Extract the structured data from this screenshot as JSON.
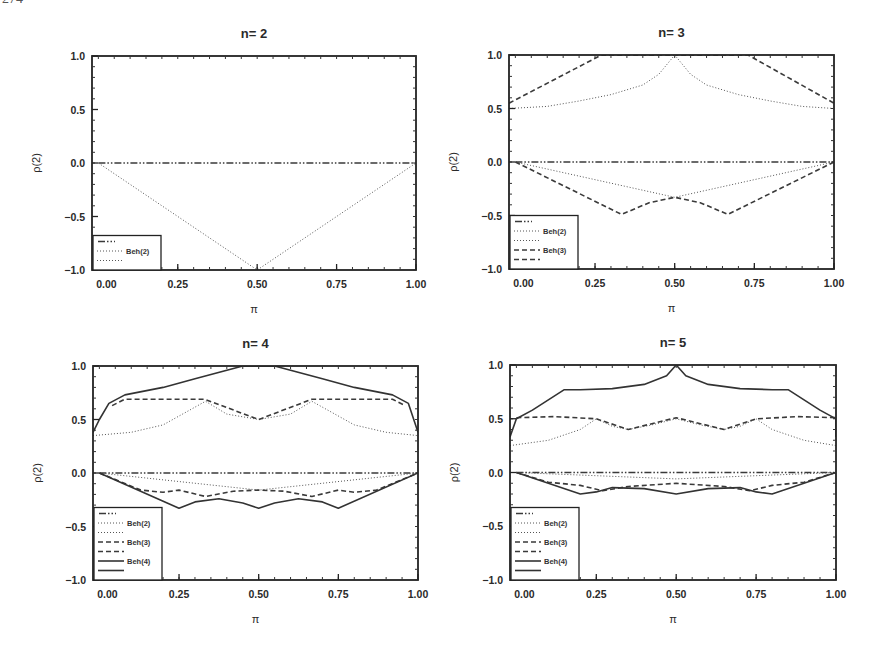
{
  "page": {
    "number_fragment": "274"
  },
  "chart_data": [
    {
      "type": "line",
      "title": "n= 2",
      "xlabel": "π",
      "ylabel": "ρ(2)",
      "xlim": [
        -0.02,
        1.0
      ],
      "ylim": [
        -1.0,
        1.0
      ],
      "xticks": [
        "0.00",
        "0.25",
        "0.50",
        "0.75",
        "1.00"
      ],
      "yticks": [
        "1.0",
        "0.5",
        "0.0",
        "-0.5",
        "-1.0"
      ],
      "frame": {
        "x": 92,
        "y": 56,
        "w": 324,
        "h": 214
      },
      "legend": {
        "position": "lower left",
        "entries": [
          {
            "style": "dashdot",
            "label": ""
          },
          {
            "style": "dotted",
            "label": "Beh(2)"
          },
          {
            "style": "dotted",
            "label": ""
          }
        ]
      },
      "series": [
        {
          "name": "zero",
          "style": "dashdot",
          "x": [
            0,
            1
          ],
          "y": [
            0,
            0
          ]
        },
        {
          "name": "Beh(2) lower",
          "style": "dotted",
          "x": [
            0,
            0.5,
            1
          ],
          "y": [
            0,
            -1.0,
            0
          ]
        }
      ]
    },
    {
      "type": "line",
      "title": "n= 3",
      "xlabel": "π",
      "ylabel": "ρ(2)",
      "xlim": [
        -0.02,
        1.0
      ],
      "ylim": [
        -1.0,
        1.0
      ],
      "xticks": [
        "0.00",
        "0.25",
        "0.50",
        "0.75",
        "1.00"
      ],
      "yticks": [
        "1.0",
        "0.5",
        "0.0",
        "-0.5",
        "-1.0"
      ],
      "frame": {
        "x": 509,
        "y": 55,
        "w": 325,
        "h": 214
      },
      "legend": {
        "position": "lower left",
        "entries": [
          {
            "style": "dashdot",
            "label": ""
          },
          {
            "style": "dotted",
            "label": "Beh(2)"
          },
          {
            "style": "dotted",
            "label": ""
          },
          {
            "style": "dashed",
            "label": "Beh(3)"
          },
          {
            "style": "dashed",
            "label": ""
          }
        ]
      },
      "series": [
        {
          "name": "zero",
          "style": "dashdot",
          "x": [
            0,
            1
          ],
          "y": [
            0,
            0
          ]
        },
        {
          "name": "Beh(2) upper",
          "style": "dotted",
          "x": [
            -0.02,
            0.1,
            0.2,
            0.3,
            0.4,
            0.45,
            0.5,
            0.55,
            0.6,
            0.7,
            0.8,
            0.9,
            1.0
          ],
          "y": [
            0.5,
            0.52,
            0.57,
            0.63,
            0.72,
            0.82,
            1.0,
            0.82,
            0.72,
            0.63,
            0.57,
            0.52,
            0.5
          ]
        },
        {
          "name": "Beh(2) lower",
          "style": "dotted",
          "x": [
            0,
            0.5,
            1
          ],
          "y": [
            0,
            -0.33,
            0
          ]
        },
        {
          "name": "Beh(3) upper",
          "style": "dashed",
          "x": [
            -0.02,
            0.27,
            0.73,
            1.0
          ],
          "y": [
            0.55,
            1.0,
            1.0,
            0.55
          ]
        },
        {
          "name": "Beh(3) lower",
          "style": "dashed",
          "x": [
            0,
            0.333,
            0.42,
            0.5,
            0.58,
            0.667,
            1.0
          ],
          "y": [
            0,
            -0.49,
            -0.38,
            -0.33,
            -0.38,
            -0.49,
            0
          ]
        }
      ]
    },
    {
      "type": "line",
      "title": "n= 4",
      "xlabel": "π",
      "ylabel": "ρ(2)",
      "xlim": [
        -0.02,
        1.0
      ],
      "ylim": [
        -1.0,
        1.0
      ],
      "xticks": [
        "0.00",
        "0.25",
        "0.50",
        "0.75",
        "1.00"
      ],
      "yticks": [
        "1.0",
        "0.5",
        "0.0",
        "-0.5",
        "-1.0"
      ],
      "frame": {
        "x": 93,
        "y": 366,
        "w": 325,
        "h": 214
      },
      "legend": {
        "position": "lower left",
        "entries": [
          {
            "style": "dashdot",
            "label": ""
          },
          {
            "style": "dotted",
            "label": "Beh(2)"
          },
          {
            "style": "dotted",
            "label": ""
          },
          {
            "style": "dashed",
            "label": "Beh(3)"
          },
          {
            "style": "dashed",
            "label": ""
          },
          {
            "style": "solid",
            "label": "Beh(4)"
          },
          {
            "style": "solid",
            "label": ""
          }
        ]
      },
      "series": [
        {
          "name": "zero",
          "style": "dashdot",
          "x": [
            0,
            1
          ],
          "y": [
            0,
            0
          ]
        },
        {
          "name": "Beh(2) upper",
          "style": "dotted",
          "x": [
            -0.02,
            0.1,
            0.2,
            0.333,
            0.4,
            0.5,
            0.6,
            0.667,
            0.8,
            0.9,
            1.0
          ],
          "y": [
            0.35,
            0.38,
            0.45,
            0.67,
            0.55,
            0.5,
            0.55,
            0.67,
            0.45,
            0.38,
            0.35
          ]
        },
        {
          "name": "Beh(2) lower",
          "style": "dotted",
          "x": [
            0,
            0.5,
            1
          ],
          "y": [
            0,
            -0.16,
            0
          ]
        },
        {
          "name": "Beh(3) upper",
          "style": "dashed",
          "x": [
            0.04,
            0.08,
            0.33,
            0.5,
            0.667,
            0.92,
            0.96
          ],
          "y": [
            0.63,
            0.69,
            0.69,
            0.5,
            0.69,
            0.69,
            0.63
          ]
        },
        {
          "name": "Beh(3) lower",
          "style": "dashed",
          "x": [
            0,
            0.13,
            0.2,
            0.25,
            0.333,
            0.42,
            0.5,
            0.58,
            0.667,
            0.75,
            0.8,
            0.87,
            1.0
          ],
          "y": [
            0,
            -0.16,
            -0.18,
            -0.16,
            -0.22,
            -0.17,
            -0.16,
            -0.17,
            -0.22,
            -0.16,
            -0.18,
            -0.16,
            0
          ]
        },
        {
          "name": "Beh(4) upper",
          "style": "solid",
          "x": [
            -0.02,
            0.0,
            0.03,
            0.08,
            0.2,
            0.3,
            0.45,
            0.5,
            0.55,
            0.7,
            0.8,
            0.92,
            0.97,
            1.0
          ],
          "y": [
            0.38,
            0.5,
            0.65,
            0.73,
            0.8,
            0.88,
            1.0,
            1.0,
            1.0,
            0.88,
            0.8,
            0.73,
            0.65,
            0.38
          ]
        },
        {
          "name": "Beh(4) lower",
          "style": "solid",
          "x": [
            0,
            0.25,
            0.3,
            0.375,
            0.45,
            0.5,
            0.55,
            0.625,
            0.7,
            0.75,
            1.0
          ],
          "y": [
            0,
            -0.33,
            -0.27,
            -0.24,
            -0.28,
            -0.33,
            -0.28,
            -0.24,
            -0.27,
            -0.33,
            0
          ]
        }
      ]
    },
    {
      "type": "line",
      "title": "n= 5",
      "xlabel": "π",
      "ylabel": "ρ(2)",
      "xlim": [
        -0.02,
        1.0
      ],
      "ylim": [
        -1.0,
        1.0
      ],
      "xticks": [
        "0.00",
        "0.25",
        "0.50",
        "0.75",
        "1.00"
      ],
      "yticks": [
        "1.0",
        "0.5",
        "0.0",
        "-0.5",
        "-1.0"
      ],
      "frame": {
        "x": 510,
        "y": 365,
        "w": 326,
        "h": 215
      },
      "legend": {
        "position": "lower left",
        "entries": [
          {
            "style": "dashdot",
            "label": ""
          },
          {
            "style": "dotted",
            "label": "Beh(2)"
          },
          {
            "style": "dotted",
            "label": ""
          },
          {
            "style": "dashed",
            "label": "Beh(3)"
          },
          {
            "style": "dashed",
            "label": ""
          },
          {
            "style": "solid",
            "label": "Beh(4)"
          },
          {
            "style": "solid",
            "label": ""
          }
        ]
      },
      "series": [
        {
          "name": "zero",
          "style": "dashdot",
          "x": [
            0,
            1
          ],
          "y": [
            0,
            0
          ]
        },
        {
          "name": "Beh(2) upper",
          "style": "dotted",
          "x": [
            -0.02,
            0.1,
            0.2,
            0.25,
            0.3,
            0.35,
            0.42,
            0.5,
            0.58,
            0.65,
            0.7,
            0.75,
            0.8,
            0.9,
            1.0
          ],
          "y": [
            0.25,
            0.3,
            0.4,
            0.5,
            0.43,
            0.4,
            0.44,
            0.5,
            0.44,
            0.4,
            0.43,
            0.5,
            0.4,
            0.3,
            0.25
          ]
        },
        {
          "name": "Beh(2) lower",
          "style": "dotted",
          "x": [
            0,
            0.5,
            1
          ],
          "y": [
            0,
            -0.06,
            0
          ]
        },
        {
          "name": "Beh(3) upper",
          "style": "dashed",
          "x": [
            0.0,
            0.12,
            0.25,
            0.35,
            0.5,
            0.65,
            0.75,
            0.88,
            1.0
          ],
          "y": [
            0.51,
            0.52,
            0.5,
            0.4,
            0.51,
            0.4,
            0.5,
            0.52,
            0.51
          ]
        },
        {
          "name": "Beh(3) lower",
          "style": "dashed",
          "x": [
            0,
            0.1,
            0.2,
            0.27,
            0.35,
            0.5,
            0.65,
            0.73,
            0.8,
            0.9,
            1.0
          ],
          "y": [
            0,
            -0.09,
            -0.12,
            -0.17,
            -0.13,
            -0.1,
            -0.13,
            -0.17,
            -0.12,
            -0.09,
            0
          ]
        },
        {
          "name": "Beh(4) upper",
          "style": "solid",
          "x": [
            -0.02,
            0.0,
            0.05,
            0.15,
            0.2,
            0.3,
            0.4,
            0.47,
            0.5,
            0.53,
            0.6,
            0.7,
            0.8,
            0.85,
            0.95,
            1.0,
            1.0
          ],
          "y": [
            0.33,
            0.5,
            0.58,
            0.77,
            0.77,
            0.78,
            0.82,
            0.9,
            1.0,
            0.9,
            0.82,
            0.78,
            0.77,
            0.77,
            0.58,
            0.5,
            0.33
          ]
        },
        {
          "name": "Beh(4) lower",
          "style": "solid",
          "x": [
            0,
            0.2,
            0.25,
            0.3,
            0.4,
            0.5,
            0.6,
            0.7,
            0.75,
            0.8,
            1.0
          ],
          "y": [
            0,
            -0.2,
            -0.18,
            -0.14,
            -0.15,
            -0.2,
            -0.15,
            -0.14,
            -0.18,
            -0.2,
            0
          ]
        }
      ]
    }
  ]
}
